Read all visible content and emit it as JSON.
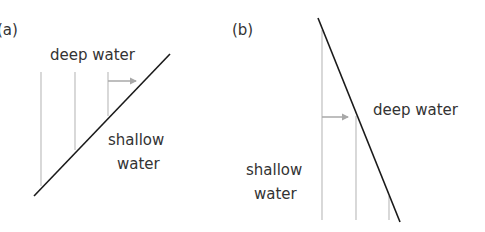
{
  "colors": {
    "boundary": "#1a1a1a",
    "wavefront": "#c4c4c4",
    "arrow": "#a8a8a8",
    "text": "#333333"
  },
  "panels": [
    {
      "id": "a",
      "label": "(a)",
      "deep_label": "deep water",
      "shallow_label_line1": "shallow",
      "shallow_label_line2": "water"
    },
    {
      "id": "b",
      "label": "(b)",
      "deep_label": "deep water",
      "shallow_label_line1": "shallow",
      "shallow_label_line2": "water"
    }
  ]
}
